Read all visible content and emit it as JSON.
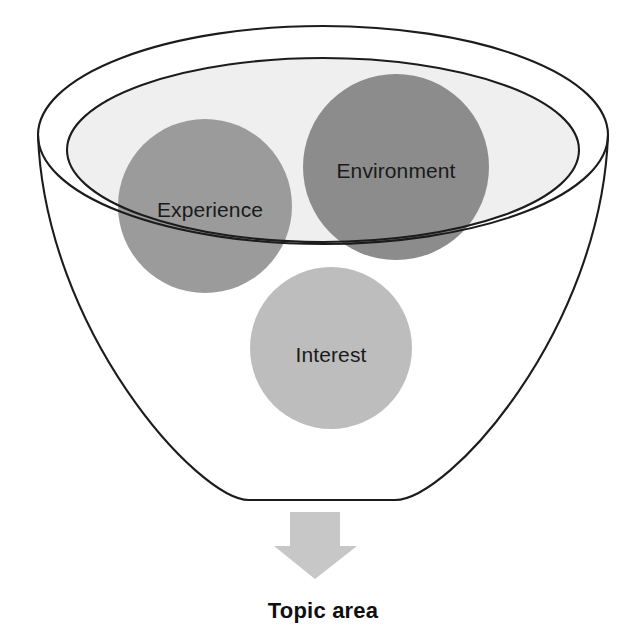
{
  "diagram": {
    "title_text": "Topic area",
    "type": "funnel-diagram",
    "description_labels": {
      "outer_rim": "funnel-outer-rim",
      "inner_rim": "funnel-inner-rim",
      "cone": "funnel-cone"
    },
    "bubbles": [
      {
        "id": "experience",
        "label": "Experience",
        "fill": "#9b9b9b",
        "cx": 205,
        "cy": 206,
        "r": 87
      },
      {
        "id": "environment",
        "label": "Environment",
        "fill": "#8c8c8c",
        "cx": 396,
        "cy": 167,
        "r": 93
      },
      {
        "id": "interest",
        "label": "Interest",
        "fill": "#bdbdbd",
        "cx": 331,
        "cy": 348,
        "r": 81
      }
    ],
    "arrow": {
      "id": "down-arrow",
      "fill": "#c7c7c7",
      "direction": "down"
    },
    "colors": {
      "outline": "#1c1c1c",
      "funnel_inner_fill": "#efefef",
      "funnel_cone_fill": "#ffffff",
      "page_background": "#ffffff",
      "text": "#1a1a1a"
    },
    "geometry": {
      "outer_ellipse": {
        "cx": 323,
        "cy": 135,
        "rx": 285,
        "ry": 109
      },
      "inner_ellipse": {
        "cx": 323,
        "cy": 150,
        "rx": 256,
        "ry": 92
      },
      "funnel_bottom_y": 499,
      "funnel_bottom_left_x": 249,
      "funnel_bottom_right_x": 395
    }
  }
}
